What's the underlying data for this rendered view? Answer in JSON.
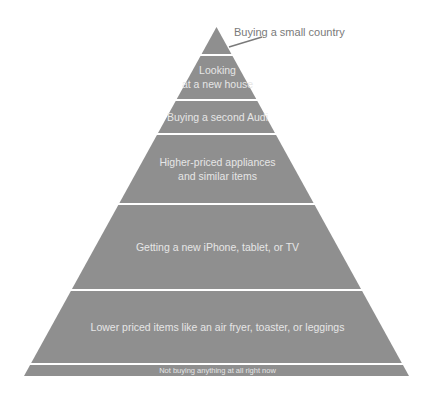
{
  "diagram": {
    "type": "pyramid",
    "fill_color": "#8f8f8f",
    "gap_color": "#ffffff",
    "text_color": "#e6e6e6",
    "callout_color": "#7a7a7a",
    "callout": {
      "label": "Buying a small country"
    },
    "tiers": [
      {
        "lines": [],
        "note": "apex"
      },
      {
        "lines": [
          "Looking",
          "at a new house"
        ]
      },
      {
        "lines": [
          "Buying a second Audi"
        ]
      },
      {
        "lines": [
          "Higher-priced appliances",
          "and similar items"
        ]
      },
      {
        "lines": [
          "Getting a new iPhone, tablet, or TV"
        ]
      },
      {
        "lines": [
          "Lower priced items like an air fryer, toaster, or leggings"
        ]
      },
      {
        "lines": [
          "Not buying anything at all right now"
        ]
      }
    ]
  }
}
